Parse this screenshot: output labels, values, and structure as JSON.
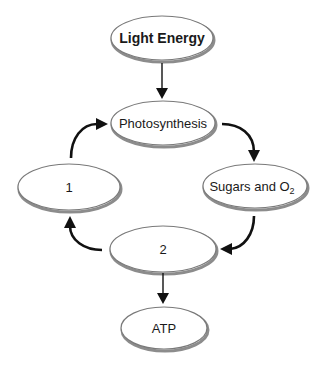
{
  "diagram": {
    "type": "cycle-flow",
    "nodes": [
      {
        "id": "light_energy",
        "label": "Light Energy",
        "bold": true
      },
      {
        "id": "photosynthesis",
        "label": "Photosynthesis",
        "bold": false
      },
      {
        "id": "sugars_o2",
        "label_main": "Sugars and O",
        "label_sub": "2",
        "bold": false
      },
      {
        "id": "node_2",
        "label": "2",
        "bold": false
      },
      {
        "id": "node_1",
        "label": "1",
        "bold": false
      },
      {
        "id": "atp",
        "label": "ATP",
        "bold": false
      }
    ],
    "edges": [
      {
        "from": "light_energy",
        "to": "photosynthesis",
        "style": "straight"
      },
      {
        "from": "photosynthesis",
        "to": "sugars_o2",
        "style": "curved"
      },
      {
        "from": "sugars_o2",
        "to": "node_2",
        "style": "curved"
      },
      {
        "from": "node_2",
        "to": "node_1",
        "style": "curved"
      },
      {
        "from": "node_1",
        "to": "photosynthesis",
        "style": "curved"
      },
      {
        "from": "node_2",
        "to": "atp",
        "style": "straight"
      }
    ],
    "colors": {
      "outline": "#7a7a7a",
      "shadow": "#8c8c8c",
      "arrow": "#111111",
      "text": "#1a1a1a",
      "background": "#ffffff"
    }
  }
}
